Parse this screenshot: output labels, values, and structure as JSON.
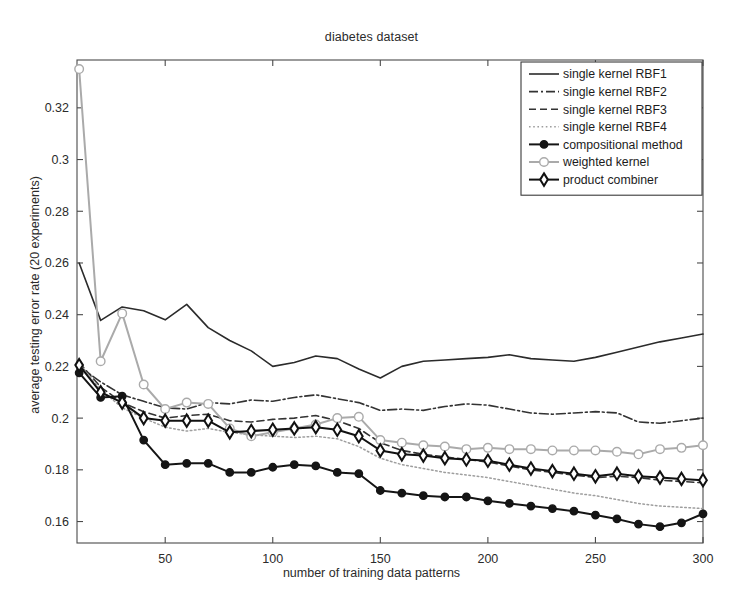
{
  "chart_data": {
    "type": "line",
    "title": "diabetes dataset",
    "xlabel": "number of training data patterns",
    "ylabel": "average testing error rate (20 experiments)",
    "xlim": [
      9,
      300
    ],
    "ylim": [
      0.1517,
      0.3385
    ],
    "xticks": [
      50,
      100,
      150,
      200,
      250,
      300
    ],
    "yticks": [
      0.16,
      0.18,
      0.2,
      0.22,
      0.24,
      0.26,
      0.28,
      0.3,
      0.32
    ],
    "ytick_labels": [
      "0.16",
      "0.18",
      "0.2",
      "0.22",
      "0.24",
      "0.26",
      "0.28",
      "0.3",
      "0.32"
    ],
    "grid": false,
    "legend_position": "top-right",
    "x": [
      10,
      20,
      30,
      40,
      50,
      60,
      70,
      80,
      90,
      100,
      110,
      120,
      130,
      140,
      150,
      160,
      170,
      180,
      190,
      200,
      210,
      220,
      230,
      240,
      250,
      260,
      270,
      280,
      290,
      300
    ],
    "series": [
      {
        "name": "single kernel RBF1",
        "style": "solid",
        "color": "#2b2b2b",
        "marker": "none",
        "values": [
          0.26,
          0.2378,
          0.243,
          0.2415,
          0.238,
          0.244,
          0.235,
          0.23,
          0.226,
          0.22,
          0.2215,
          0.224,
          0.223,
          0.219,
          0.2155,
          0.22,
          0.222,
          0.2225,
          0.223,
          0.2235,
          0.2245,
          0.223,
          0.2225,
          0.222,
          0.2235,
          0.2255,
          0.2275,
          0.2295,
          0.231,
          0.2325
        ]
      },
      {
        "name": "single kernel RBF2",
        "style": "dashdot",
        "color": "#333333",
        "marker": "none",
        "values": [
          0.22,
          0.214,
          0.209,
          0.2065,
          0.204,
          0.2035,
          0.206,
          0.2055,
          0.207,
          0.2065,
          0.208,
          0.209,
          0.2075,
          0.206,
          0.203,
          0.2035,
          0.203,
          0.2045,
          0.2055,
          0.205,
          0.2035,
          0.202,
          0.2015,
          0.202,
          0.2025,
          0.202,
          0.1985,
          0.198,
          0.199,
          0.2
        ]
      },
      {
        "name": "single kernel RBF3",
        "style": "dashed",
        "color": "#333333",
        "marker": "none",
        "values": [
          0.2215,
          0.212,
          0.206,
          0.2025,
          0.2,
          0.201,
          0.2015,
          0.199,
          0.1985,
          0.1995,
          0.2,
          0.201,
          0.199,
          0.196,
          0.1905,
          0.1875,
          0.186,
          0.185,
          0.184,
          0.183,
          0.1815,
          0.18,
          0.179,
          0.178,
          0.177,
          0.1775,
          0.177,
          0.176,
          0.1755,
          0.175
        ]
      },
      {
        "name": "single kernel RBF4",
        "style": "dotted",
        "color": "#9e9e9e",
        "marker": "none",
        "values": [
          0.221,
          0.211,
          0.204,
          0.2,
          0.1965,
          0.195,
          0.196,
          0.1945,
          0.1935,
          0.193,
          0.1925,
          0.193,
          0.192,
          0.189,
          0.1845,
          0.182,
          0.1805,
          0.179,
          0.178,
          0.177,
          0.1755,
          0.174,
          0.1725,
          0.171,
          0.17,
          0.1685,
          0.167,
          0.166,
          0.1655,
          0.165
        ]
      },
      {
        "name": "compositional method",
        "style": "solid",
        "color": "#151515",
        "marker": "filled-circle",
        "values": [
          0.2175,
          0.208,
          0.2085,
          0.1915,
          0.182,
          0.1825,
          0.1825,
          0.179,
          0.179,
          0.181,
          0.182,
          0.1815,
          0.179,
          0.1785,
          0.172,
          0.171,
          0.17,
          0.1695,
          0.1695,
          0.168,
          0.167,
          0.166,
          0.165,
          0.164,
          0.1625,
          0.161,
          0.159,
          0.158,
          0.1595,
          0.163
        ]
      },
      {
        "name": "weighted kernel",
        "style": "solid",
        "color": "#aaaaaa",
        "marker": "open-circle",
        "values": [
          0.335,
          0.222,
          0.2405,
          0.213,
          0.2035,
          0.206,
          0.2055,
          0.196,
          0.193,
          0.1945,
          0.196,
          0.1975,
          0.2,
          0.2005,
          0.1915,
          0.1905,
          0.1895,
          0.189,
          0.188,
          0.1885,
          0.188,
          0.188,
          0.1875,
          0.1875,
          0.1875,
          0.187,
          0.186,
          0.188,
          0.1885,
          0.1895
        ]
      },
      {
        "name": "product combiner",
        "style": "solid",
        "color": "#111111",
        "marker": "diamond",
        "values": [
          0.2205,
          0.21,
          0.206,
          0.2,
          0.199,
          0.199,
          0.199,
          0.1945,
          0.195,
          0.1955,
          0.196,
          0.1965,
          0.1955,
          0.193,
          0.1875,
          0.186,
          0.1855,
          0.1845,
          0.184,
          0.1835,
          0.182,
          0.1805,
          0.1795,
          0.1785,
          0.1775,
          0.1785,
          0.1775,
          0.177,
          0.1765,
          0.176
        ]
      }
    ]
  },
  "legend": {
    "items": [
      {
        "label": "single kernel RBF1"
      },
      {
        "label": "single kernel RBF2"
      },
      {
        "label": "single kernel RBF3"
      },
      {
        "label": "single kernel RBF4"
      },
      {
        "label": "compositional method"
      },
      {
        "label": "weighted kernel"
      },
      {
        "label": "product combiner"
      }
    ]
  }
}
